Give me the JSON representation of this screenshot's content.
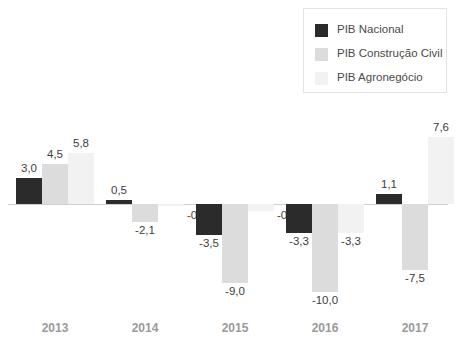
{
  "chart_data": {
    "type": "bar",
    "title": "",
    "subtitle": "",
    "xlabel": "",
    "ylabel": "",
    "categories": [
      "2013",
      "2014",
      "2015",
      "2016",
      "2017"
    ],
    "series": [
      {
        "name": "PIB Nacional",
        "color": "#2b2b2b",
        "values": [
          3.0,
          0.5,
          -3.5,
          -3.3,
          1.1
        ],
        "labels": [
          "3,0",
          "0,5",
          "-3,5",
          "-3,3",
          "1,1"
        ]
      },
      {
        "name": "PIB Construção Civil",
        "color": "#dcdcdc",
        "values": [
          4.5,
          -2.1,
          -9.0,
          -10.0,
          -7.5
        ],
        "labels": [
          "4,5",
          "-2,1",
          "-9,0",
          "-10,0",
          "-7,5"
        ]
      },
      {
        "name": "PIB Agronegócio",
        "color": "#f2f2f2",
        "values": [
          5.8,
          -0.1,
          -0.8,
          -3.3,
          7.6
        ],
        "labels": [
          "5,8",
          "-0,1",
          "-0,8",
          "-3,3",
          "7,6"
        ]
      }
    ],
    "ylim": [
      -10.0,
      7.6
    ],
    "grid": false,
    "legend_position": "top-right",
    "decimal_separator": ","
  },
  "legend": {
    "items": [
      {
        "label": "PIB Nacional",
        "color": "#2b2b2b"
      },
      {
        "label": "PIB Construção Civil",
        "color": "#dcdcdc"
      },
      {
        "label": "PIB Agronegócio",
        "color": "#f2f2f2"
      }
    ]
  },
  "axis": {
    "ticks": [
      "2013",
      "2014",
      "2015",
      "2016",
      "2017"
    ],
    "tick_color": "#9a9a9a",
    "zero_line_color": "#cfcfcf"
  }
}
